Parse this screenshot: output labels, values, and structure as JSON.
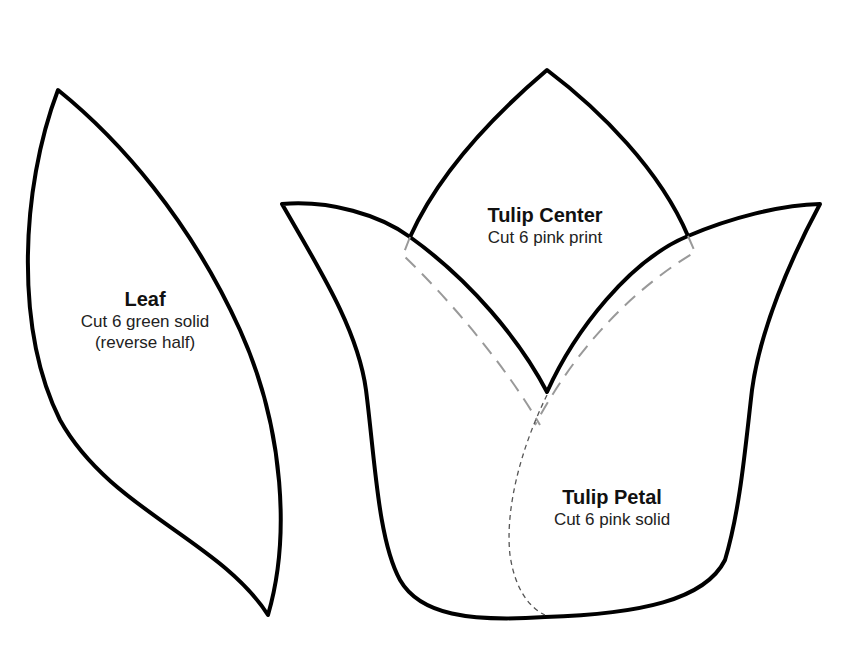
{
  "pieces": {
    "leaf": {
      "title": "Leaf",
      "lines": [
        "Cut 6 green solid",
        "(reverse half)"
      ]
    },
    "tulip_center": {
      "title": "Tulip Center",
      "lines": [
        "Cut 6 pink print"
      ]
    },
    "tulip_petal": {
      "title": "Tulip Petal",
      "lines": [
        "Cut 6 pink solid"
      ]
    }
  },
  "colors": {
    "outline": "#000000",
    "seam_allowance": "#999999",
    "fold_line": "#555555",
    "background": "#ffffff"
  }
}
